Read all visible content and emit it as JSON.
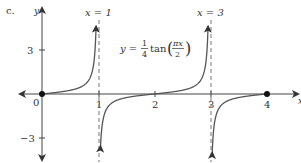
{
  "figure": {
    "part_label": "c.",
    "axes": {
      "x_label": "x",
      "y_label": "y",
      "x_ticks": [
        "0",
        "1",
        "2",
        "3",
        "4"
      ],
      "y_ticks": [
        "3",
        "−3"
      ]
    },
    "asymptotes": [
      {
        "label": "x = 1",
        "x": 1
      },
      {
        "label": "x = 3",
        "x": 3
      }
    ],
    "equation": {
      "lhs": "y =",
      "frac_num": "1",
      "frac_den": "4",
      "func": "tan",
      "arg_num": "πx",
      "arg_den": "2"
    },
    "points": [
      {
        "x": 0,
        "y": 0
      },
      {
        "x": 4,
        "y": 0
      }
    ],
    "colors": {
      "curve": "#555555",
      "axis": "#444444",
      "asymptote": "#777777",
      "text": "#333333"
    }
  }
}
